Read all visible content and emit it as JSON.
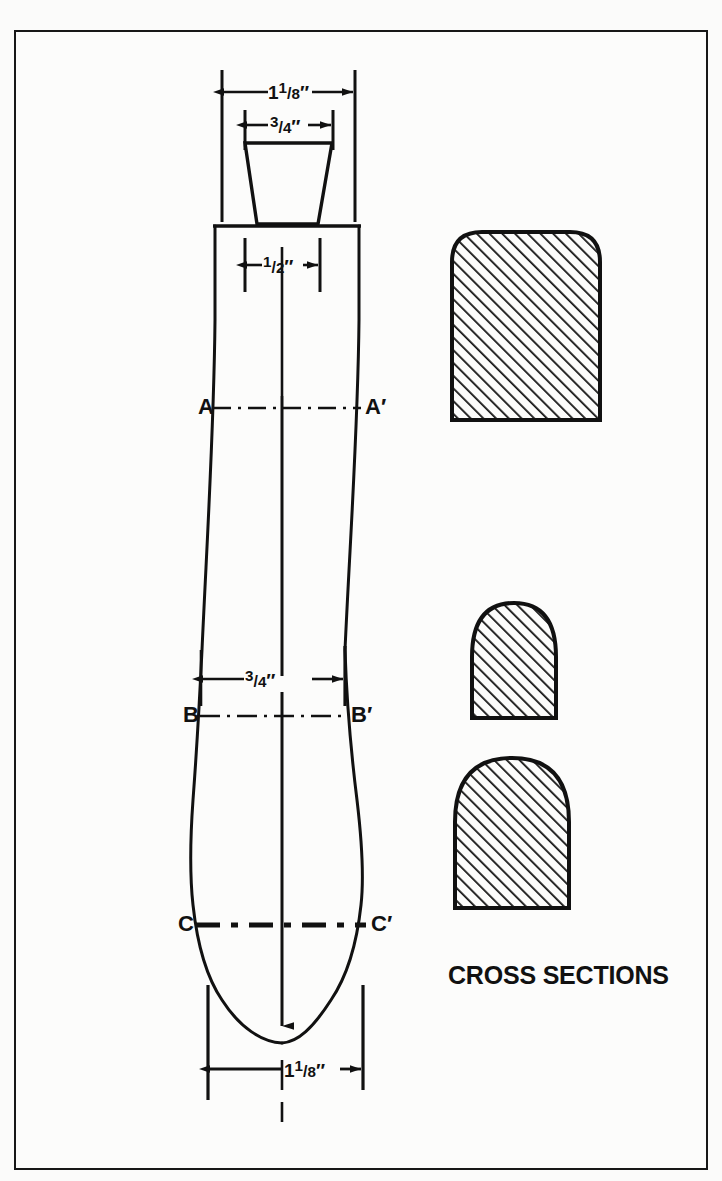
{
  "figure": {
    "caption": "CROSS SECTIONS",
    "background_color": "#fbfbfa",
    "ink_color": "#111111"
  },
  "dimensions": [
    {
      "id": "knob-outer-width",
      "value": "1⅛″",
      "whole": "1",
      "num": "1",
      "den": "8",
      "label": "1 1/8″"
    },
    {
      "id": "knob-top-width",
      "value": "¾″",
      "whole": "",
      "num": "3",
      "den": "4",
      "label": "3/4″"
    },
    {
      "id": "handle-width",
      "value": "½″",
      "whole": "",
      "num": "1",
      "den": "2",
      "label": "1/2″"
    },
    {
      "id": "mid-width",
      "value": "¾″",
      "whole": "",
      "num": "3",
      "den": "4",
      "label": "3/4″"
    },
    {
      "id": "barrel-width",
      "value": "1⅛″",
      "whole": "1",
      "num": "1",
      "den": "8",
      "label": "1 1/8″"
    }
  ],
  "section_lines": [
    {
      "id": "a",
      "left_label": "A",
      "right_label": "A′",
      "style": "dash-dot-thin"
    },
    {
      "id": "b",
      "left_label": "B",
      "right_label": "B′",
      "style": "dash-dot-thin"
    },
    {
      "id": "c",
      "left_label": "C",
      "right_label": "C′",
      "style": "dash-dot-thick"
    }
  ],
  "cross_sections": [
    {
      "id": "section-a",
      "shape": "rounded-top-rectangle",
      "hatch": "diagonal"
    },
    {
      "id": "section-b",
      "shape": "domed-arch",
      "hatch": "diagonal"
    },
    {
      "id": "section-c",
      "shape": "rounded-arch",
      "hatch": "diagonal"
    }
  ]
}
